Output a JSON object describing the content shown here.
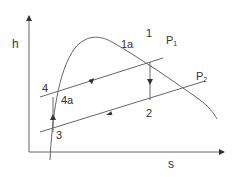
{
  "diagram": {
    "type": "refrigeration cycle on h-s (Mollier) chart",
    "axes": {
      "y_label": "h",
      "x_label": "s"
    },
    "isobars": [
      {
        "name": "P",
        "sub": "1"
      },
      {
        "name": "P",
        "sub": "2"
      }
    ],
    "points": {
      "p1": "1",
      "p1a": "1a",
      "p2": "2",
      "p3": "3",
      "p4": "4",
      "p4a": "4a"
    },
    "colors": {
      "line": "#555555",
      "text": "#333333",
      "background": "#ffffff"
    }
  }
}
